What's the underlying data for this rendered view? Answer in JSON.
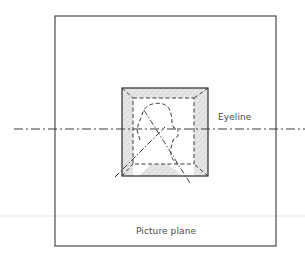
{
  "diagram": {
    "labels": {
      "eyeline": "Eyeline",
      "picture_plane": "Picture plane"
    },
    "elements": {
      "picture_plane_frame": {
        "x": 55,
        "y": 16,
        "width": 221,
        "height": 230
      },
      "eyeline": {
        "y": 129,
        "x_start": 14,
        "x_end": 305,
        "style": "dash-dot"
      },
      "ground_line": {
        "y": 216,
        "color": "#e4e4e4"
      },
      "outer_box": {
        "x": 122,
        "y": 88,
        "width": 86,
        "height": 88
      },
      "inner_box": {
        "x": 133,
        "y": 98,
        "width": 61,
        "height": 66,
        "style": "dashed"
      }
    },
    "colors": {
      "line": "#3a3a3a",
      "shade": "#d9d9d9",
      "text": "#4a4a4a",
      "ground_line": "#e4e4e4"
    }
  }
}
